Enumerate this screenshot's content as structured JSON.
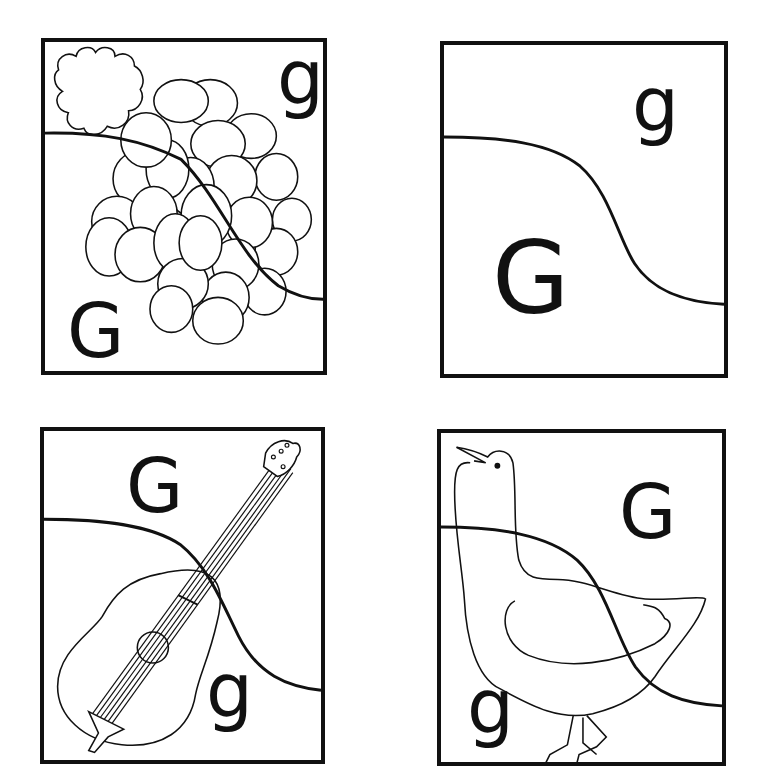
{
  "worksheet": {
    "title": "Letter G matching puzzle cards",
    "line_color": "#111111",
    "background": "#ffffff"
  },
  "cards": [
    {
      "position": "top-left",
      "picture": "grapes",
      "uppercase": "G",
      "lowercase": "g"
    },
    {
      "position": "top-right",
      "picture": "none",
      "uppercase": "G",
      "lowercase": "g"
    },
    {
      "position": "bottom-left",
      "picture": "guitar",
      "uppercase": "G",
      "lowercase": "g"
    },
    {
      "position": "bottom-right",
      "picture": "goose",
      "uppercase": "G",
      "lowercase": "g"
    }
  ]
}
